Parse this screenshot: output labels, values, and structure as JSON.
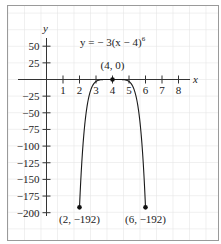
{
  "chart_data": {
    "type": "line",
    "title": "",
    "equation": "y = − 3(x − 4)",
    "equation_exponent": "6",
    "function": "y = -3(x - 4)^6",
    "xlabel": "x",
    "ylabel": "y",
    "xlim": [
      0,
      8
    ],
    "ylim": [
      -200,
      50
    ],
    "x_ticks": [
      1,
      2,
      3,
      4,
      5,
      6,
      7,
      8
    ],
    "x_tick_labels": [
      "1",
      "2",
      "3",
      "4",
      "5",
      "6",
      "7",
      "8"
    ],
    "y_ticks": [
      50,
      25,
      -25,
      -50,
      -75,
      -100,
      -125,
      -150,
      -175,
      -200
    ],
    "y_tick_labels": [
      "50",
      "25",
      "−25",
      "−50",
      "−75",
      "−100",
      "−125",
      "−150",
      "−175",
      "−200"
    ],
    "grid": true,
    "domain": [
      2,
      6
    ],
    "series": [
      {
        "name": "y = -3(x - 4)^6",
        "x": [
          2,
          2.5,
          3,
          3.5,
          4,
          4.5,
          5,
          5.5,
          6
        ],
        "y": [
          -192,
          -34.17,
          -3,
          -0.05,
          0,
          -0.05,
          -3,
          -34.17,
          -192
        ]
      }
    ],
    "points": [
      {
        "x": 4,
        "y": 0,
        "label": "(4, 0)"
      },
      {
        "x": 2,
        "y": -192,
        "label": "(2, −192)"
      },
      {
        "x": 6,
        "y": -192,
        "label": "(6, −192)"
      }
    ],
    "colors": {
      "curve": "#1a1a1a",
      "axis": "#333333",
      "grid": "#e6e6e6",
      "frame": "#9a9a9a"
    }
  }
}
